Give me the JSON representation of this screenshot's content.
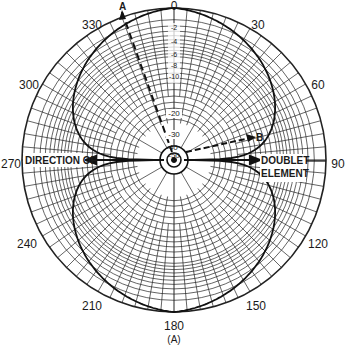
{
  "chart_data": {
    "type": "polar",
    "title": "",
    "caption": "(A)",
    "angular_ticks": [
      "0",
      "30",
      "60",
      "90",
      "120",
      "150",
      "180",
      "210",
      "240",
      "270",
      "300",
      "330"
    ],
    "radial_unit": "dB",
    "radial_ticks": [
      "0",
      "-2",
      "-4",
      "-6",
      "-8",
      "-10",
      "-20",
      "-30",
      "-40",
      "-50"
    ],
    "radial_tick_values": [
      0,
      -2,
      -4,
      -6,
      -8,
      -10,
      -20,
      -30,
      -40,
      -50
    ],
    "series": [
      {
        "name": "Doublet radiation pattern",
        "description": "Figure-eight pattern, maxima (0 dB) at 0 and 180 degrees, nulls toward 90 and 270 degrees",
        "theta_deg": [
          0,
          15,
          30,
          45,
          60,
          75,
          80,
          85,
          90,
          95,
          100,
          105,
          120,
          135,
          150,
          165,
          180,
          195,
          210,
          225,
          240,
          255,
          260,
          265,
          270,
          275,
          280,
          285,
          300,
          315,
          330,
          345
        ],
        "gain_db": [
          0,
          -0.3,
          -1.2,
          -3.0,
          -6.0,
          -11.7,
          -15.2,
          -21.2,
          -50,
          -21.2,
          -15.2,
          -11.7,
          -6.0,
          -3.0,
          -1.2,
          -0.3,
          0,
          -0.3,
          -1.2,
          -3.0,
          -6.0,
          -11.7,
          -15.2,
          -21.2,
          -50,
          -21.2,
          -15.2,
          -11.7,
          -6.0,
          -3.0,
          -1.2,
          -0.3
        ]
      }
    ],
    "annotations": [
      {
        "label": "A",
        "type": "dashed-line",
        "angle_deg": 340
      },
      {
        "label": "B",
        "type": "dashed-arrow",
        "angle_deg": 80
      },
      {
        "label": "DIRECTION OF",
        "position": "left, along 270 axis"
      },
      {
        "label": "DOUBLET ELEMENT",
        "position": "right, along 90 axis"
      }
    ],
    "grid": true,
    "legend": "none"
  },
  "labels": {
    "angles": {
      "a0": "0",
      "a30": "30",
      "a60": "60",
      "a90": "90",
      "a120": "120",
      "a150": "150",
      "a180": "180",
      "a210": "210",
      "a240": "240",
      "a270": "270",
      "a300": "300",
      "a330": "330"
    },
    "radial": {
      "r2": "-2",
      "r4": "-4",
      "r6": "-6",
      "r8": "-8",
      "r10": "-10",
      "r20": "-20",
      "r30": "-30",
      "r40": "-40",
      "r50": "-50"
    },
    "direction_left": "DIRECTION OF",
    "doublet_line1": "DOUBLET",
    "doublet_line2": "ELEMENT",
    "marker_a": "A",
    "marker_b": "B",
    "caption": "(A)"
  }
}
